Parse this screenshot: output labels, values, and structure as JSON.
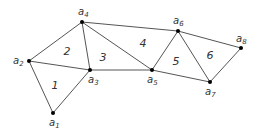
{
  "diagram": {
    "type": "triangulation",
    "vertices": [
      {
        "id": "a1",
        "base": "a",
        "sub": "1",
        "x": 53,
        "y": 113,
        "lx": 49,
        "ly": 126
      },
      {
        "id": "a2",
        "base": "a",
        "sub": "2",
        "x": 29,
        "y": 61,
        "lx": 13,
        "ly": 64
      },
      {
        "id": "a3",
        "base": "a",
        "sub": "3",
        "x": 90,
        "y": 70,
        "lx": 88,
        "ly": 83
      },
      {
        "id": "a4",
        "base": "a",
        "sub": "4",
        "x": 82,
        "y": 22,
        "lx": 78,
        "ly": 15
      },
      {
        "id": "a5",
        "base": "a",
        "sub": "5",
        "x": 152,
        "y": 70,
        "lx": 147,
        "ly": 83
      },
      {
        "id": "a6",
        "base": "a",
        "sub": "6",
        "x": 178,
        "y": 31,
        "lx": 173,
        "ly": 24
      },
      {
        "id": "a7",
        "base": "a",
        "sub": "7",
        "x": 210,
        "y": 82,
        "lx": 205,
        "ly": 95
      },
      {
        "id": "a8",
        "base": "a",
        "sub": "8",
        "x": 241,
        "y": 48,
        "lx": 236,
        "ly": 42
      }
    ],
    "edges": [
      [
        "a1",
        "a2"
      ],
      [
        "a1",
        "a3"
      ],
      [
        "a2",
        "a3"
      ],
      [
        "a2",
        "a4"
      ],
      [
        "a4",
        "a3"
      ],
      [
        "a4",
        "a5"
      ],
      [
        "a3",
        "a5"
      ],
      [
        "a4",
        "a6"
      ],
      [
        "a6",
        "a5"
      ],
      [
        "a5",
        "a7"
      ],
      [
        "a6",
        "a7"
      ],
      [
        "a6",
        "a8"
      ],
      [
        "a8",
        "a7"
      ]
    ],
    "faces": [
      {
        "label": "1",
        "x": 55,
        "y": 89
      },
      {
        "label": "2",
        "x": 67,
        "y": 55
      },
      {
        "label": "3",
        "x": 103,
        "y": 61
      },
      {
        "label": "4",
        "x": 143,
        "y": 47
      },
      {
        "label": "5",
        "x": 176,
        "y": 65
      },
      {
        "label": "6",
        "x": 210,
        "y": 59
      }
    ]
  }
}
